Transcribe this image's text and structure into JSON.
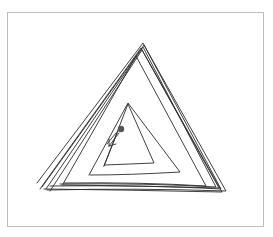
{
  "image": {
    "description": "Hand-drawn spiral triangle sketch inside a light gray frame",
    "caption": "",
    "colors": {
      "background": "#ffffff",
      "frame": "#bdbdbd",
      "stroke": "#2b2b2b",
      "dot": "#555555"
    },
    "strokes": [
      {
        "name": "outer-triangle-1",
        "points": "37,183 143,43 221,190 52,186"
      },
      {
        "name": "outer-triangle-2",
        "points": "41,187 144,45 225,191 47,190"
      },
      {
        "name": "outer-triangle-3",
        "points": "46,189 143,47 216,186 62,183"
      },
      {
        "name": "outer-triangle-4",
        "points": "50,191 142,50 219,188 65,184"
      },
      {
        "name": "middle-triangle",
        "points": "63,184 137,55 205,186 64,183"
      },
      {
        "name": "inner-triangle-1",
        "points": "89,175 127,104 180,172 90,175"
      },
      {
        "name": "inner-triangle-2",
        "points": "104,166 129,104 153,163 105,165"
      }
    ],
    "pen_start": {
      "x": 121,
      "y": 129,
      "r": 3.2
    },
    "arrow": {
      "points": "119,133 110,145 116,144",
      "tail": "112,141 108,146"
    }
  }
}
